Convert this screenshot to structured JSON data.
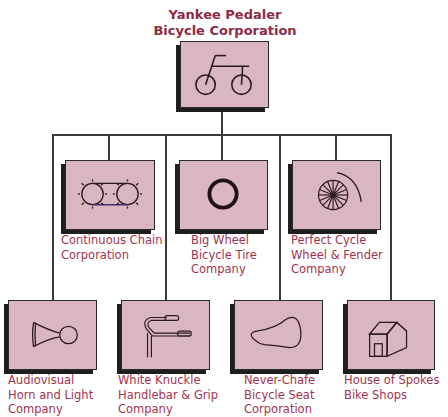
{
  "root": {
    "title_lines": [
      "Yankee Pedaler",
      "Bicycle Corporation"
    ],
    "icon": "bicycle-icon"
  },
  "subsidiaries": [
    {
      "lines": [
        "Continuous Chain",
        "Corporation"
      ],
      "icon": "chain-sprocket-icon"
    },
    {
      "lines": [
        "Big Wheel",
        "Bicycle Tire",
        "Company"
      ],
      "icon": "tire-icon"
    },
    {
      "lines": [
        "Perfect Cycle",
        "Wheel & Fender",
        "Company"
      ],
      "icon": "spoked-wheel-fender-icon"
    },
    {
      "lines": [
        "Audiovisual",
        "Horn and Light",
        "Company"
      ],
      "icon": "horn-icon"
    },
    {
      "lines": [
        "White Knuckle",
        "Handlebar & Grip",
        "Company"
      ],
      "icon": "handlebar-icon"
    },
    {
      "lines": [
        "Never-Chafe",
        "Bicycle Seat",
        "Corporation"
      ],
      "icon": "bicycle-seat-icon"
    },
    {
      "lines": [
        "House of Spokes",
        "Bike Shops"
      ],
      "icon": "house-icon"
    }
  ],
  "colors": {
    "title": "#8e2a44",
    "label": "#a2334f",
    "box_fill": "#d9b6c2",
    "box_shadow": "#1e1e1e",
    "connector": "#3a3a3a"
  }
}
